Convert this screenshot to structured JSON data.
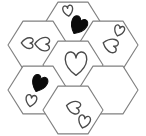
{
  "figure": {
    "type": "counting-worksheet-figure",
    "width": 146,
    "height": 136,
    "background_color": "#ffffff",
    "hexagon_stroke_color": "#808080",
    "heart_outline_color": "#4a4a4a",
    "heart_fill_color": "#0b0b0b",
    "hexagon_count": 7,
    "total_hearts": 11,
    "outlined_heart_count": 9,
    "filled_heart_count": 2,
    "orientation": "flat-top",
    "layout_name": "hexagonal flower / honeycomb rosette"
  },
  "hexagons": [
    {
      "id": "hex-top-center",
      "label": "top center hexagon",
      "cx": 73,
      "cy": 26,
      "radius": 30,
      "heart_count": 2,
      "hearts": [
        {
          "id": "heart-tc-1",
          "style": "outline",
          "size": 11,
          "rotation": -8,
          "cx": 68,
          "cy": 11
        },
        {
          "id": "heart-tc-2",
          "style": "filled",
          "size": 18,
          "rotation": 28,
          "cx": 78,
          "cy": 26
        }
      ]
    },
    {
      "id": "hex-upper-left",
      "label": "upper left hexagon",
      "cx": 38,
      "cy": 45,
      "radius": 30,
      "heart_count": 2,
      "hearts": [
        {
          "id": "heart-ul-1",
          "style": "outline",
          "size": 12,
          "rotation": 92,
          "cx": 27,
          "cy": 43
        },
        {
          "id": "heart-ul-2",
          "style": "outline",
          "size": 15,
          "rotation": 92,
          "cx": 42,
          "cy": 44
        }
      ]
    },
    {
      "id": "hex-upper-right",
      "label": "upper right hexagon",
      "cx": 108,
      "cy": 45,
      "radius": 30,
      "heart_count": 2,
      "hearts": [
        {
          "id": "heart-ur-1",
          "style": "outline",
          "size": 11,
          "rotation": 18,
          "cx": 119,
          "cy": 31
        },
        {
          "id": "heart-ur-2",
          "style": "outline",
          "size": 15,
          "rotation": 108,
          "cx": 110,
          "cy": 45
        }
      ]
    },
    {
      "id": "hex-center",
      "label": "center hexagon",
      "cx": 73,
      "cy": 65,
      "radius": 30,
      "heart_count": 1,
      "hearts": [
        {
          "id": "heart-c-1",
          "style": "outline",
          "size": 24,
          "rotation": 0,
          "cx": 76,
          "cy": 64
        }
      ]
    },
    {
      "id": "hex-lower-left",
      "label": "lower left hexagon",
      "cx": 38,
      "cy": 90,
      "radius": 30,
      "heart_count": 2,
      "hearts": [
        {
          "id": "heart-ll-1",
          "style": "filled",
          "size": 17,
          "rotation": 22,
          "cx": 39,
          "cy": 84
        },
        {
          "id": "heart-ll-2",
          "style": "outline",
          "size": 12,
          "rotation": 10,
          "cx": 31,
          "cy": 101
        }
      ]
    },
    {
      "id": "hex-lower-right",
      "label": "lower right hexagon",
      "cx": 108,
      "cy": 90,
      "radius": 30,
      "heart_count": 0,
      "hearts": []
    },
    {
      "id": "hex-bottom-center",
      "label": "bottom center hexagon",
      "cx": 73,
      "cy": 110,
      "radius": 30,
      "heart_count": 2,
      "hearts": [
        {
          "id": "heart-bc-1",
          "style": "outline",
          "size": 14,
          "rotation": 104,
          "cx": 73,
          "cy": 107
        },
        {
          "id": "heart-bc-2",
          "style": "outline",
          "size": 13,
          "rotation": 14,
          "cx": 84,
          "cy": 122
        }
      ]
    }
  ]
}
